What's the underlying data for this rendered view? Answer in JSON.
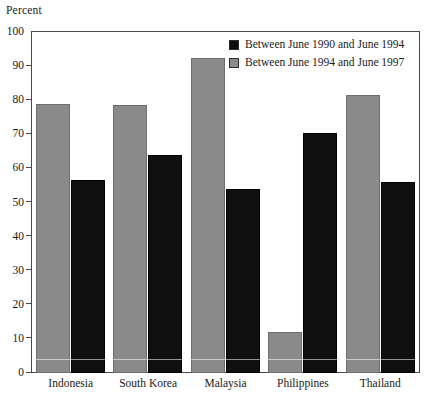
{
  "chart_data": {
    "type": "bar",
    "title": "",
    "ylabel": "Percent",
    "xlabel": "",
    "ylim": [
      0,
      100
    ],
    "yticks": [
      0,
      10,
      20,
      30,
      40,
      50,
      60,
      70,
      80,
      90,
      100
    ],
    "grid": false,
    "legend_position": "top-right",
    "categories": [
      "Indonesia",
      "South Korea",
      "Malaysia",
      "Philippines",
      "Thailand"
    ],
    "series": [
      {
        "name": "Between June 1990 and June 1994",
        "color": "#0d0d0d",
        "values": [
          56.5,
          64.0,
          54.0,
          70.5,
          56.0
        ]
      },
      {
        "name": "Between June 1994 and June 1997",
        "color": "#8a8a8a",
        "values": [
          79.0,
          78.5,
          92.5,
          12.0,
          81.5
        ]
      }
    ]
  },
  "legend": {
    "items": [
      {
        "label": "Between June 1990 and June 1994",
        "swatch": "black"
      },
      {
        "label": "Between June 1994 and June 1997",
        "swatch": "gray"
      }
    ]
  }
}
